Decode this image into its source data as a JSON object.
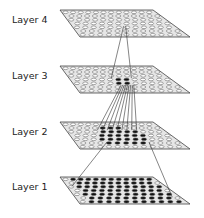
{
  "diagram": {
    "type": "hierarchical-layers",
    "layers": [
      {
        "label": "Layer 4",
        "y": 10,
        "label_y": 14,
        "active": "single"
      },
      {
        "label": "Layer 3",
        "y": 66,
        "label_y": 70,
        "active": "cluster-small"
      },
      {
        "label": "Layer 2",
        "y": 122,
        "label_y": 126,
        "active": "cluster-large"
      },
      {
        "label": "Layer 1",
        "y": 177,
        "label_y": 181,
        "active": "all"
      }
    ],
    "colors": {
      "plane_fill": "#e6e6e6",
      "plane_stroke": "#444444",
      "node_open": "#ffffff",
      "node_active": "#111111",
      "line": "#333333"
    }
  }
}
